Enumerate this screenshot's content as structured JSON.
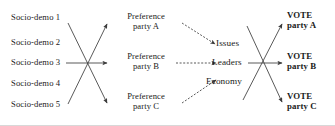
{
  "figure": {
    "type": "path-diagram",
    "colors": {
      "background": "#ffffff",
      "text": "#1a1a1a",
      "edge": "#3c3c3c",
      "border": "#d8d8d8"
    }
  },
  "columns": {
    "socio_demographics": {
      "label": "Socio-demo",
      "items": [
        {
          "text": "Socio-demo 1"
        },
        {
          "text": "Socio-demo 2"
        },
        {
          "text": "Socio-demo 3"
        },
        {
          "text": "Socio-demo 4"
        },
        {
          "text": "Socio-demo 5"
        }
      ]
    },
    "preferences": {
      "items": [
        {
          "line1": "Preference",
          "line2": "party A"
        },
        {
          "line1": "Preference",
          "line2": "party B"
        },
        {
          "line1": "Preference",
          "line2": "party C"
        }
      ]
    },
    "short_term_factors": {
      "items": [
        {
          "text": "Issues"
        },
        {
          "text": "Leaders"
        },
        {
          "text": "Economy"
        }
      ]
    },
    "vote": {
      "items": [
        {
          "line1": "VOTE",
          "line2": "party A"
        },
        {
          "line1": "VOTE",
          "line2": "party B"
        },
        {
          "line1": "VOTE",
          "line2": "party C"
        }
      ]
    }
  },
  "edges": {
    "group_1": {
      "name": "socio-demo-to-preference",
      "style": "solid",
      "count": 3,
      "crossing": true
    },
    "group_2": {
      "name": "preference-to-short-term-factors",
      "style": "dashed",
      "count": 3,
      "crossing": false
    },
    "group_3": {
      "name": "short-term-factors-to-vote",
      "style": "solid",
      "count": 3,
      "crossing": true
    }
  }
}
